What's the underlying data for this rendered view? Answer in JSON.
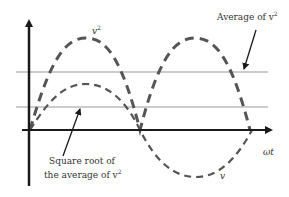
{
  "diagram": {
    "labels": {
      "v_squared_base": "v",
      "v_squared_exp": "2",
      "average_base": "Average of v",
      "average_exp": "2",
      "rms_line1": "Square root of",
      "rms_line2_base": "the average of v",
      "rms_line2_exp": "2",
      "omega_t": "ωt",
      "v": "v"
    },
    "colors": {
      "axis": "#1a1a1a",
      "curve": "#555555",
      "reference_line": "#999999",
      "text": "#333333"
    }
  }
}
